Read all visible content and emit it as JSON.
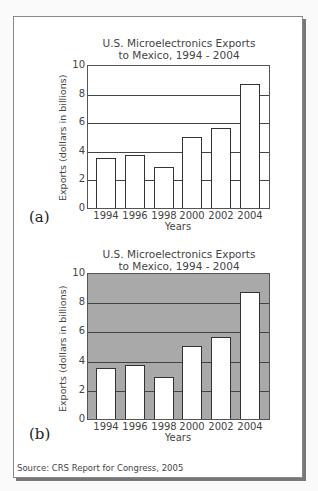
{
  "chart_data": [
    {
      "type": "bar",
      "panel": "(a)",
      "title": "U.S. Microelectronics Exports to Mexico, 1994 - 2004",
      "title_lines": [
        "U.S. Microelectronics Exports",
        "to Mexico, 1994 - 2004"
      ],
      "xlabel": "Years",
      "ylabel": "Exports (dollars in billions)",
      "categories": [
        "1994",
        "1996",
        "1998",
        "2000",
        "2002",
        "2004"
      ],
      "values": [
        3.5,
        3.7,
        2.9,
        5.0,
        5.6,
        8.7
      ],
      "ylim": [
        0,
        10
      ],
      "yticks": [
        "0",
        "2",
        "4",
        "6",
        "8",
        "10"
      ],
      "grid": true,
      "background": "#ffffff"
    },
    {
      "type": "bar",
      "panel": "(b)",
      "title": "U.S. Microelectronics Exports to Mexico, 1994 - 2004",
      "title_lines": [
        "U.S. Microelectronics Exports",
        "to Mexico, 1994 - 2004"
      ],
      "xlabel": "Years",
      "ylabel": "Exports (dollars in billions)",
      "categories": [
        "1994",
        "1996",
        "1998",
        "2000",
        "2002",
        "2004"
      ],
      "values": [
        3.5,
        3.7,
        2.9,
        5.0,
        5.6,
        8.7
      ],
      "ylim": [
        0,
        10
      ],
      "yticks": [
        "0",
        "2",
        "4",
        "6",
        "8",
        "10"
      ],
      "grid": true,
      "background": "#a9a9a9"
    }
  ],
  "source": "Source: CRS Report for Congress, 2005"
}
